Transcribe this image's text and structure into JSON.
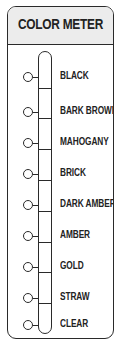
{
  "title": "COLOR METER",
  "levels": [
    {
      "label": "BLACK"
    },
    {
      "label": "BARK BROWN"
    },
    {
      "label": "MAHOGANY"
    },
    {
      "label": "BRICK"
    },
    {
      "label": "DARK AMBER"
    },
    {
      "label": "AMBER"
    },
    {
      "label": "GOLD"
    },
    {
      "label": "STRAW"
    },
    {
      "label": "CLEAR"
    }
  ],
  "colors": {
    "stroke": "#2a2a2a",
    "header_bg": "#ececec",
    "text": "#222222"
  }
}
